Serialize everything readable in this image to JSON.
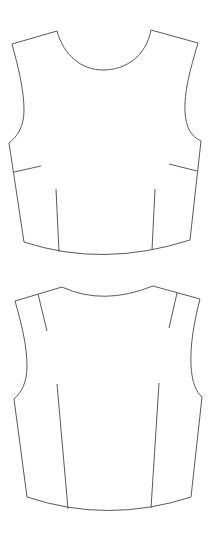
{
  "diagram": {
    "type": "garment-technical-flat",
    "line_color": "#5a5a5a",
    "background": "#ffffff",
    "pieces": [
      {
        "name": "bodice-front",
        "neckline": "scoop",
        "darts": [
          "left-side-bust-dart",
          "right-side-bust-dart",
          "left-waist-dart",
          "right-waist-dart"
        ]
      },
      {
        "name": "bodice-back",
        "neckline": "shallow-curve",
        "darts": [
          "left-shoulder-dart",
          "right-shoulder-dart",
          "left-waist-dart",
          "right-waist-dart"
        ]
      }
    ]
  }
}
